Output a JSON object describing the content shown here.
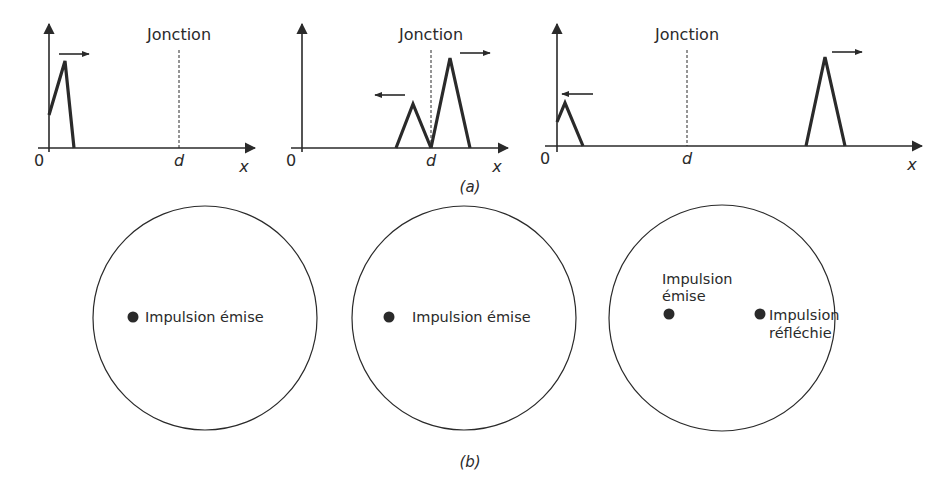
{
  "figure": {
    "part_a_caption": "(a)",
    "part_b_caption": "(b)",
    "colors": {
      "ink": "#2a2a2a",
      "background": "#ffffff"
    }
  },
  "panels_a": [
    {
      "junction_label": "Jonction",
      "origin_label": "0",
      "d_label": "d",
      "x_label": "x",
      "description": "Incident pulse near origin moving right"
    },
    {
      "junction_label": "Jonction",
      "origin_label": "0",
      "d_label": "d",
      "x_label": "x",
      "description": "Reflected pulse moving left, transmitted pulse moving right at junction"
    },
    {
      "junction_label": "Jonction",
      "origin_label": "0",
      "d_label": "d",
      "x_label": "x",
      "description": "Reflected pulse back at origin moving left, transmitted pulse far right moving right"
    }
  ],
  "panels_b": [
    {
      "dots": [
        {
          "label": "Impulsion émise"
        }
      ]
    },
    {
      "dots": [
        {
          "label": "Impulsion émise"
        }
      ]
    },
    {
      "dots": [
        {
          "label_line1": "Impulsion",
          "label_line2": "émise"
        },
        {
          "label_line1": "Impulsion",
          "label_line2": "réfléchie"
        }
      ]
    }
  ]
}
